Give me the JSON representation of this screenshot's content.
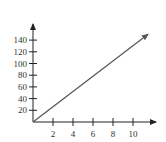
{
  "chart_data": {
    "type": "line",
    "title": "",
    "xlabel": "",
    "ylabel": "",
    "x_ticks": [
      2,
      4,
      6,
      8,
      10
    ],
    "y_ticks": [
      20,
      40,
      60,
      80,
      100,
      120,
      140
    ],
    "xlim": [
      0,
      12
    ],
    "ylim": [
      0,
      160
    ],
    "grid": false,
    "legend": null,
    "series": [
      {
        "name": "line",
        "x": [
          0,
          11.5
        ],
        "y": [
          0,
          150
        ],
        "arrow_end": true,
        "color": "#555555"
      }
    ],
    "axes_arrows": true
  }
}
